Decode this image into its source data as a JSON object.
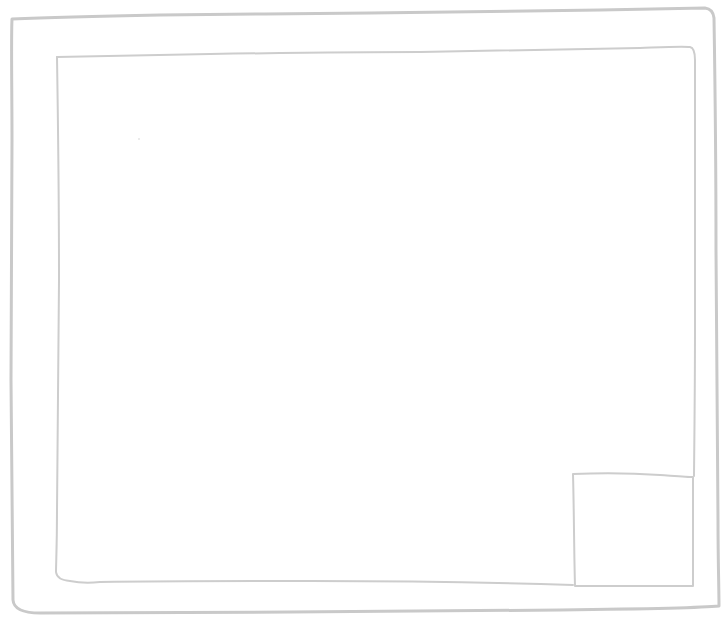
{
  "wireframe": {
    "style": {
      "stroke_color": "#c9c9c9",
      "inner_stroke_color": "#cdcdcd",
      "background": "#ffffff"
    },
    "outer_frame": {
      "label": "",
      "bounds": {
        "x": 10,
        "y": 17,
        "width": 709,
        "height": 597
      }
    },
    "inner_frame": {
      "label": "",
      "bounds": {
        "x": 55,
        "y": 48,
        "width": 640,
        "height": 537
      }
    },
    "corner_box": {
      "label": "",
      "bounds": {
        "x": 573,
        "y": 474,
        "width": 120,
        "height": 112
      }
    }
  }
}
